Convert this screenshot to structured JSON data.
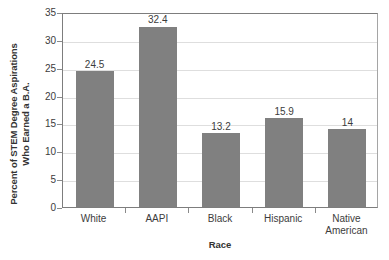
{
  "chart_data": {
    "type": "bar",
    "title": "",
    "subtitle": "",
    "xlabel": "Race",
    "ylabel": "Percent of STEM Degree Aspirations Who Earned a B.A.",
    "ylabel_lines": [
      "Percent of STEM Degree Aspirations",
      "Who Earned a B.A."
    ],
    "categories": [
      "White",
      "AAPI",
      "Black",
      "Hispanic",
      "Native American"
    ],
    "category_label_lines": [
      [
        "White"
      ],
      [
        "AAPI"
      ],
      [
        "Black"
      ],
      [
        "Hispanic"
      ],
      [
        "Native",
        "American"
      ]
    ],
    "values": [
      24.5,
      32.4,
      13.2,
      15.9,
      14
    ],
    "value_labels": [
      "24.5",
      "32.4",
      "13.2",
      "15.9",
      "14"
    ],
    "ylim": [
      0,
      35
    ],
    "ytick_values": [
      0,
      5,
      10,
      15,
      20,
      25,
      30,
      35
    ],
    "ytick_labels": [
      "0",
      "5",
      "10",
      "15",
      "20",
      "25",
      "30",
      "35"
    ],
    "grid": true,
    "grid_axis": "y",
    "legend": false,
    "legend_position": "none",
    "bar_color": "#808080",
    "grid_color": "#dedede",
    "axis_color": "#7d7d7d",
    "background_color": "#ffffff",
    "text_color": "#3c3c3c"
  }
}
